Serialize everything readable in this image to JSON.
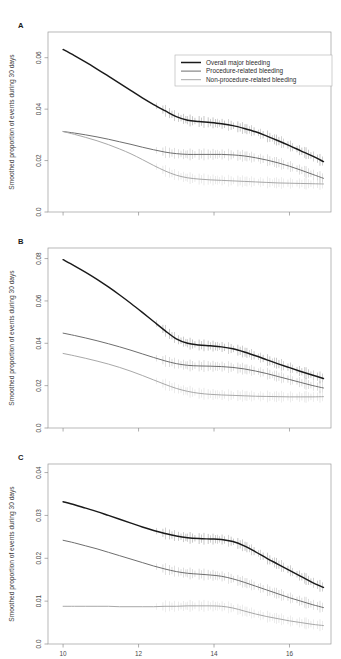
{
  "figure": {
    "width": 341,
    "height": 659,
    "background": "#ffffff"
  },
  "colors": {
    "series_overall": "#1a1a1a",
    "series_procedure": "#6e6e6e",
    "series_nonprocedure": "#a8a8a8",
    "axis": "#8d8d8d",
    "frame": "#9a9a9a",
    "text": "#3a3a3a"
  },
  "legend": {
    "position": "top-right-panel-A",
    "entries": [
      {
        "label": "Overall major bleeding",
        "color": "#1a1a1a"
      },
      {
        "label": "Procedure-related bleeding",
        "color": "#6e6e6e"
      },
      {
        "label": "Non-procedure-related bleeding",
        "color": "#a8a8a8"
      }
    ]
  },
  "panels": {
    "a": {
      "letter": "A",
      "ylabel": "Smoothed proportion of events during 30 days"
    },
    "b": {
      "letter": "B",
      "ylabel": "Smoothed proportion of events during 30 days"
    },
    "c": {
      "letter": "C",
      "ylabel": "Smoothed proportion of events during 30 days"
    }
  },
  "chart_data": [
    {
      "type": "line",
      "panel": "A",
      "title": "",
      "xlabel": "",
      "ylabel": "Smoothed proportion of events during 30 days",
      "xlim": [
        9.6,
        17.1
      ],
      "ylim": [
        0.0,
        0.07
      ],
      "xticks": [
        10,
        12,
        14,
        16
      ],
      "xtick_labels": [
        "10",
        "12",
        "14",
        "16"
      ],
      "yticks": [
        0.0,
        0.02,
        0.04,
        0.06
      ],
      "ytick_labels": [
        "0.0",
        "0.02",
        "0.04",
        "0.06"
      ],
      "grid": false,
      "legend": "inside-top-right",
      "x": [
        10.0,
        10.3,
        10.6,
        10.9,
        11.2,
        11.5,
        11.8,
        12.1,
        12.4,
        12.7,
        13.0,
        13.3,
        13.6,
        13.9,
        14.2,
        14.5,
        14.8,
        15.1,
        15.4,
        15.7,
        16.0,
        16.3,
        16.6,
        16.9
      ],
      "series": [
        {
          "name": "Overall major bleeding",
          "color": "#1a1a1a",
          "values": [
            0.0632,
            0.0608,
            0.0583,
            0.0556,
            0.0528,
            0.05,
            0.0472,
            0.0444,
            0.0418,
            0.0394,
            0.0371,
            0.0357,
            0.0352,
            0.0348,
            0.0343,
            0.0336,
            0.0325,
            0.0312,
            0.0295,
            0.0277,
            0.0258,
            0.0238,
            0.0218,
            0.0196
          ]
        },
        {
          "name": "Procedure-related bleeding",
          "color": "#6e6e6e",
          "values": [
            0.0313,
            0.0307,
            0.03,
            0.0292,
            0.0283,
            0.0273,
            0.0263,
            0.0252,
            0.0242,
            0.0233,
            0.0227,
            0.0224,
            0.0224,
            0.0224,
            0.0224,
            0.0222,
            0.0218,
            0.0211,
            0.0202,
            0.0191,
            0.0178,
            0.0163,
            0.0147,
            0.0131
          ]
        },
        {
          "name": "Non-procedure-related bleeding",
          "color": "#a8a8a8",
          "values": [
            0.0313,
            0.0302,
            0.029,
            0.0277,
            0.0262,
            0.0245,
            0.0226,
            0.0204,
            0.0181,
            0.016,
            0.0143,
            0.0133,
            0.0128,
            0.0125,
            0.0123,
            0.0121,
            0.0119,
            0.0117,
            0.0115,
            0.0113,
            0.0112,
            0.0111,
            0.011,
            0.0109
          ]
        }
      ]
    },
    {
      "type": "line",
      "panel": "B",
      "title": "",
      "xlabel": "",
      "ylabel": "Smoothed proportion of events during 30 days",
      "xlim": [
        9.6,
        17.1
      ],
      "ylim": [
        0.0,
        0.085
      ],
      "xticks": [
        10,
        12,
        14,
        16
      ],
      "xtick_labels": [
        "10",
        "12",
        "14",
        "16"
      ],
      "yticks": [
        0.0,
        0.02,
        0.04,
        0.06,
        0.08
      ],
      "ytick_labels": [
        "0.0",
        "0.02",
        "0.04",
        "0.06",
        "0.08"
      ],
      "grid": false,
      "legend": "none",
      "x": [
        10.0,
        10.3,
        10.6,
        10.9,
        11.2,
        11.5,
        11.8,
        12.1,
        12.4,
        12.7,
        13.0,
        13.3,
        13.6,
        13.9,
        14.2,
        14.5,
        14.8,
        15.1,
        15.4,
        15.7,
        16.0,
        16.3,
        16.6,
        16.9
      ],
      "series": [
        {
          "name": "Overall major bleeding",
          "color": "#1a1a1a",
          "values": [
            0.0795,
            0.0766,
            0.0735,
            0.0702,
            0.0666,
            0.0628,
            0.0588,
            0.0546,
            0.0503,
            0.046,
            0.0421,
            0.04,
            0.0392,
            0.0388,
            0.0383,
            0.0374,
            0.0359,
            0.0341,
            0.0322,
            0.0303,
            0.0285,
            0.0267,
            0.025,
            0.0234
          ]
        },
        {
          "name": "Procedure-related bleeding",
          "color": "#6e6e6e",
          "values": [
            0.0448,
            0.0437,
            0.0425,
            0.0412,
            0.0398,
            0.0383,
            0.0367,
            0.035,
            0.0333,
            0.0317,
            0.0304,
            0.0296,
            0.0293,
            0.0292,
            0.029,
            0.0286,
            0.0279,
            0.0269,
            0.0257,
            0.0243,
            0.0229,
            0.0215,
            0.0201,
            0.0189
          ]
        },
        {
          "name": "Non-procedure-related bleeding",
          "color": "#a8a8a8",
          "values": [
            0.0352,
            0.0341,
            0.0329,
            0.0316,
            0.0302,
            0.0286,
            0.0268,
            0.0248,
            0.0227,
            0.0206,
            0.0187,
            0.0173,
            0.0164,
            0.0159,
            0.0156,
            0.0154,
            0.0152,
            0.015,
            0.0149,
            0.0148,
            0.0147,
            0.0147,
            0.0147,
            0.0148
          ]
        }
      ]
    },
    {
      "type": "line",
      "panel": "C",
      "title": "",
      "xlabel": "",
      "ylabel": "Smoothed proportion of events during 30 days",
      "xlim": [
        9.6,
        17.1
      ],
      "ylim": [
        0.0,
        0.042
      ],
      "xticks": [
        10,
        12,
        14,
        16
      ],
      "xtick_labels": [
        "10",
        "12",
        "14",
        "16"
      ],
      "yticks": [
        0.0,
        0.01,
        0.02,
        0.03,
        0.04
      ],
      "ytick_labels": [
        "0.0",
        "0.01",
        "0.02",
        "0.03",
        "0.04"
      ],
      "grid": false,
      "legend": "none",
      "x": [
        10.0,
        10.3,
        10.6,
        10.9,
        11.2,
        11.5,
        11.8,
        12.1,
        12.4,
        12.7,
        13.0,
        13.3,
        13.6,
        13.9,
        14.2,
        14.5,
        14.8,
        15.1,
        15.4,
        15.7,
        16.0,
        16.3,
        16.6,
        16.9
      ],
      "series": [
        {
          "name": "Overall major bleeding",
          "color": "#1a1a1a",
          "values": [
            0.0332,
            0.0325,
            0.0317,
            0.0309,
            0.03,
            0.0291,
            0.0282,
            0.0273,
            0.0265,
            0.0258,
            0.0252,
            0.0248,
            0.0246,
            0.0245,
            0.0244,
            0.0239,
            0.0229,
            0.0215,
            0.02,
            0.0186,
            0.0172,
            0.0158,
            0.0144,
            0.0132
          ]
        },
        {
          "name": "Procedure-related bleeding",
          "color": "#6e6e6e",
          "values": [
            0.0242,
            0.0236,
            0.0229,
            0.0222,
            0.0214,
            0.0206,
            0.0198,
            0.019,
            0.0182,
            0.0175,
            0.0169,
            0.0165,
            0.0163,
            0.0161,
            0.0158,
            0.0152,
            0.0144,
            0.0135,
            0.0126,
            0.0117,
            0.0108,
            0.01,
            0.0092,
            0.0085
          ]
        },
        {
          "name": "Non-procedure-related bleeding",
          "color": "#a8a8a8",
          "values": [
            0.0088,
            0.0088,
            0.0088,
            0.0088,
            0.0088,
            0.0087,
            0.0087,
            0.0087,
            0.0087,
            0.0088,
            0.0088,
            0.0089,
            0.0089,
            0.0089,
            0.0088,
            0.0084,
            0.0077,
            0.007,
            0.0064,
            0.0059,
            0.0054,
            0.005,
            0.0046,
            0.0043
          ]
        }
      ]
    }
  ]
}
